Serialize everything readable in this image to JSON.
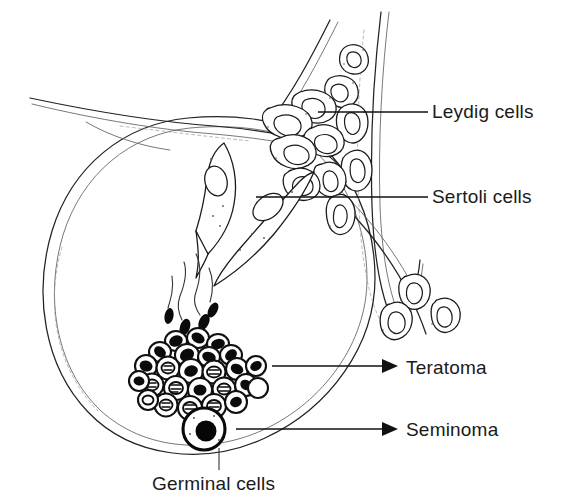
{
  "figure": {
    "background_color": "#ffffff",
    "ink_color": "#1a1a1a",
    "labels": [
      {
        "id": "leydig",
        "text": "Leydig cells",
        "x": 432,
        "y": 118,
        "leader": "line",
        "anchor_x": 318,
        "anchor_y": 112
      },
      {
        "id": "sertoli",
        "text": "Sertoli cells",
        "x": 432,
        "y": 203,
        "leader": "line",
        "anchor_x": 256,
        "anchor_y": 197
      },
      {
        "id": "teratoma",
        "text": "Teratoma",
        "x": 400,
        "y": 374,
        "leader": "arrow",
        "anchor_x": 272,
        "anchor_y": 366
      },
      {
        "id": "seminoma",
        "text": "Seminoma",
        "x": 400,
        "y": 436,
        "leader": "arrow",
        "anchor_x": 236,
        "anchor_y": 430
      },
      {
        "id": "germinal",
        "text": "Germinal cells",
        "x": 152,
        "y": 490,
        "leader": "tick",
        "anchor_x": 219,
        "anchor_y": 445
      }
    ],
    "structures": [
      {
        "name": "seminiferous-tubule",
        "shape": "large-circle",
        "description": "Large circular tubule cross-section drawn with double outline"
      },
      {
        "name": "branching-tubule-upper",
        "shape": "curved-band",
        "description": "Adjacent tubule walls sweeping across upper left and upper right"
      },
      {
        "name": "interstitial-space",
        "shape": "wedge",
        "description": "Triangular interstitial region at upper right containing Leydig cells"
      }
    ],
    "cell_groups": [
      {
        "name": "leydig-cluster-upper",
        "count": 11,
        "description": "Teardrop and crescent shaped stippled cells in upper interstitium"
      },
      {
        "name": "leydig-cluster-lower",
        "count": 3,
        "description": "Smaller group of stippled cells at lower right outside tubule"
      },
      {
        "name": "sertoli-cells",
        "count": 2,
        "description": "Elongated spindle cells with oval nuclei inside tubule"
      },
      {
        "name": "spermatozoa",
        "count": 4,
        "description": "Dark-headed sperm with long flagella rising from germinal mass"
      },
      {
        "name": "teratoma-mass",
        "count": 38,
        "description": "Dense cluster of round germ cells with dark nuclei"
      },
      {
        "name": "seminoma-cell",
        "count": 1,
        "description": "Single large round cell with heavy outline and solid black nucleus on basement membrane"
      }
    ]
  }
}
